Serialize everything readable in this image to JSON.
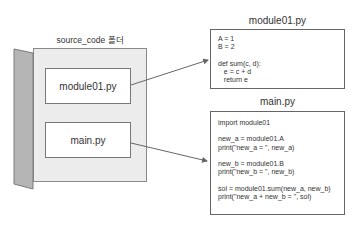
{
  "folder": {
    "label": "source_code 폴더",
    "files": [
      {
        "name": "module01.py"
      },
      {
        "name": "main.py"
      }
    ]
  },
  "code_panels": [
    {
      "title": "module01.py",
      "code": "A = 1\nB = 2\n\ndef sum(c, d):\n   e = c + d\n   return e"
    },
    {
      "title": "main.py",
      "code": "import module01\n\nnew_a = module01.A\nprint(\"new_a = \", new_a)\n\nnew_b = module01.B\nprint(\"new_b = \", new_b)\n\nsol = module01.sum(new_a, new_b)\nprint(\"new_a + new_b = \", sol)"
    }
  ],
  "colors": {
    "folder_fill": "#ececec",
    "spine_fill": "#b5b5b5",
    "arrow": "#666666"
  }
}
